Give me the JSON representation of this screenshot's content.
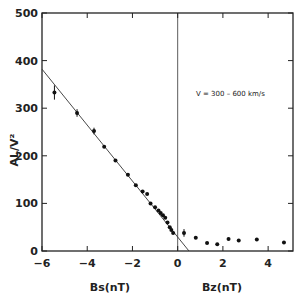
{
  "chart_data": {
    "type": "scatter",
    "title": "",
    "annotation": "V = 300 – 600 km/s",
    "ylabel": "AL/V²",
    "xlabel_left": "Bs(nT)",
    "xlabel_right": "Bz(nT)",
    "xlim": [
      -6,
      5.1
    ],
    "ylim": [
      0,
      500
    ],
    "grid": false,
    "x_ticks": [
      "-6",
      "-4",
      "-2",
      "0",
      "2",
      "4"
    ],
    "y_ticks": [
      "0",
      "100",
      "200",
      "300",
      "400",
      "500"
    ],
    "fit_line": {
      "x": [
        -6,
        0.5
      ],
      "y": [
        382,
        0
      ]
    },
    "series": [
      {
        "name": "Bs (southward)",
        "points": [
          {
            "x": -5.45,
            "y": 333,
            "err": 15
          },
          {
            "x": -4.45,
            "y": 290,
            "err": 8
          },
          {
            "x": -3.7,
            "y": 252,
            "err": 7
          },
          {
            "x": -3.25,
            "y": 219
          },
          {
            "x": -2.75,
            "y": 190
          },
          {
            "x": -2.2,
            "y": 160
          },
          {
            "x": -1.85,
            "y": 138
          },
          {
            "x": -1.55,
            "y": 125
          },
          {
            "x": -1.35,
            "y": 120
          },
          {
            "x": -1.2,
            "y": 100
          },
          {
            "x": -1.0,
            "y": 92
          },
          {
            "x": -0.85,
            "y": 85
          },
          {
            "x": -0.75,
            "y": 80
          },
          {
            "x": -0.65,
            "y": 75
          },
          {
            "x": -0.55,
            "y": 70
          },
          {
            "x": -0.45,
            "y": 60
          },
          {
            "x": -0.35,
            "y": 50
          },
          {
            "x": -0.28,
            "y": 44
          },
          {
            "x": -0.2,
            "y": 38
          }
        ]
      },
      {
        "name": "Bz (northward)",
        "points": [
          {
            "x": 0.28,
            "y": 38,
            "err": 8
          },
          {
            "x": 0.8,
            "y": 28
          },
          {
            "x": 1.3,
            "y": 17
          },
          {
            "x": 1.75,
            "y": 14
          },
          {
            "x": 2.25,
            "y": 25
          },
          {
            "x": 2.7,
            "y": 22
          },
          {
            "x": 3.5,
            "y": 24
          },
          {
            "x": 4.7,
            "y": 18
          }
        ]
      }
    ]
  }
}
